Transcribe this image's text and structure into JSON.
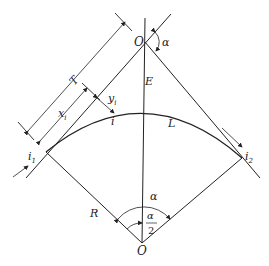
{
  "diagram": {
    "labels": {
      "vertex": "O",
      "center": "O",
      "deflection_angle": "α",
      "center_angle": "α",
      "half_angle_num": "α",
      "half_angle_den": "2",
      "tangent_length": "T",
      "x_coord": "x",
      "x_sub": "i",
      "y_coord": "y",
      "y_sub": "i",
      "point_i": "i",
      "external": "E",
      "curve_length": "L",
      "radius": "R",
      "start_point": "i",
      "start_sub": "1",
      "end_point": "i",
      "end_sub": "2"
    },
    "colors": {
      "line": "#222222",
      "background": "#ffffff"
    }
  }
}
